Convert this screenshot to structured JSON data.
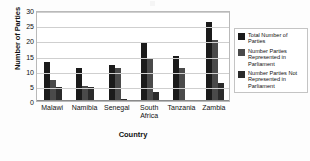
{
  "chart_data": {
    "type": "bar",
    "title": "",
    "xlabel": "Country",
    "ylabel": "Number of Parties",
    "ylim": [
      0,
      30
    ],
    "yticks": [
      0,
      5,
      10,
      15,
      20,
      25,
      30
    ],
    "grid": true,
    "legend_position": "right",
    "categories": [
      "Malawi",
      "Namibia",
      "Senegal",
      "South Africa",
      "Tanzania",
      "Zambia"
    ],
    "category_labels": [
      [
        "Malawi"
      ],
      [
        "Namibia"
      ],
      [
        "Senegal"
      ],
      [
        "South",
        "Africa"
      ],
      [
        "Tanzania"
      ],
      [
        "Zambia"
      ]
    ],
    "series": [
      {
        "name": "Total Number of Parties",
        "color": "#1b1b1b",
        "values": [
          13,
          11,
          12,
          19.5,
          15,
          26
        ]
      },
      {
        "name": "Number Parties Represented in Parliament",
        "color": "#4a4a4a",
        "values": [
          7,
          5,
          11,
          14,
          11,
          20
        ]
      },
      {
        "name": "Number Parties Not Represented in Parliament",
        "color": "#2b2b2b",
        "values": [
          4.5,
          4.5,
          0.5,
          3,
          0,
          6
        ]
      }
    ]
  },
  "legend": {
    "items": [
      {
        "label": "Total Number of Parties",
        "color": "#1b1b1b"
      },
      {
        "label": "Number Parties Represented in Parliament",
        "color": "#4a4a4a"
      },
      {
        "label": "Number Parties Not Represented in Parliament",
        "color": "#2b2b2b"
      }
    ]
  },
  "axes": {
    "y_title": "Number of Parties",
    "x_title": "Country"
  }
}
